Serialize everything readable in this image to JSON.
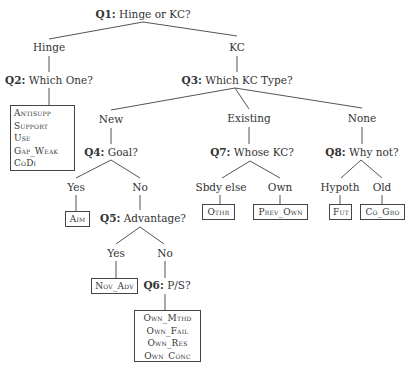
{
  "diagram": {
    "type": "decision-tree",
    "questions": {
      "q1": {
        "label": "Q1:",
        "text": "Hinge or KC?"
      },
      "q2": {
        "label": "Q2:",
        "text": "Which One?"
      },
      "q3": {
        "label": "Q3:",
        "text": "Which KC Type?"
      },
      "q4": {
        "label": "Q4:",
        "text": "Goal?"
      },
      "q5": {
        "label": "Q5:",
        "text": "Advantage?"
      },
      "q6": {
        "label": "Q6:",
        "text": "P/S?"
      },
      "q7": {
        "label": "Q7:",
        "text": "Whose KC?"
      },
      "q8": {
        "label": "Q8:",
        "text": "Why not?"
      }
    },
    "branches": {
      "hinge": "Hinge",
      "kc": "KC",
      "new": "New",
      "existing": "Existing",
      "none": "None",
      "q4_yes": "Yes",
      "q4_no": "No",
      "q5_yes": "Yes",
      "q5_no": "No",
      "sbdy_else": "Sbdy else",
      "own": "Own",
      "hypoth": "Hypoth",
      "old": "Old"
    },
    "leaves": {
      "hinge_box": [
        "Antisupp",
        "Support",
        "Use",
        "Gap_Weak",
        "CoDi"
      ],
      "aim": "Aim",
      "nov_adv": "Nov_Adv",
      "own_box": [
        "Own_Mthd",
        "Own_Fail",
        "Own_Res",
        "Own_Conc"
      ],
      "othr": "Othr",
      "prev_own": "Prev_Own",
      "fut": "Fut",
      "co_gro": "Co_Gro"
    }
  }
}
